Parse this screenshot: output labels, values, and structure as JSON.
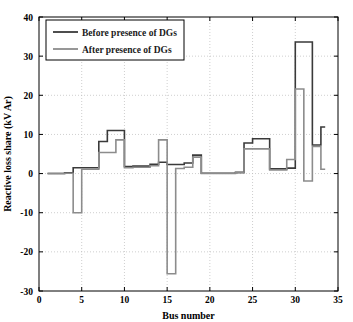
{
  "chart_data": {
    "type": "line",
    "title": "",
    "xlabel": "Bus number",
    "ylabel": "Reactive loss share (kV Ar)",
    "xlim": [
      0,
      35
    ],
    "ylim": [
      -30,
      40
    ],
    "xticks": [
      0,
      5,
      10,
      15,
      20,
      25,
      30,
      35
    ],
    "xtick_labels": [
      "0",
      "5",
      "10",
      "15",
      "20",
      "25",
      "30",
      "35"
    ],
    "yticks": [
      -30,
      -20,
      -10,
      0,
      10,
      20,
      30,
      40
    ],
    "ytick_labels": [
      "-30",
      "-20",
      "-10",
      "0",
      "10",
      "20",
      "30",
      "40"
    ],
    "grid": true,
    "legend_position": "top-left",
    "style": "stairs",
    "x": [
      1,
      2,
      3,
      4,
      5,
      6,
      7,
      8,
      9,
      10,
      11,
      12,
      13,
      14,
      15,
      16,
      17,
      18,
      19,
      20,
      21,
      22,
      23,
      24,
      25,
      26,
      27,
      28,
      29,
      30,
      31,
      32,
      33
    ],
    "series": [
      {
        "name": "Before presence of DGs",
        "color": "#3a3a3a",
        "width": 1.6,
        "values": [
          0,
          0,
          0.2,
          1.5,
          1.5,
          1.5,
          8.2,
          11.0,
          11.0,
          1.8,
          1.9,
          1.9,
          2.4,
          2.9,
          2.3,
          2.3,
          2.7,
          4.7,
          0.1,
          0.1,
          0.1,
          0.1,
          0.3,
          7.8,
          8.9,
          8.9,
          1.2,
          1.2,
          1.4,
          33.6,
          33.6,
          7.3,
          11.9
        ]
      },
      {
        "name": "After presence of DGs",
        "color": "#8c8c8c",
        "width": 1.6,
        "values": [
          0,
          0,
          0.1,
          -10.0,
          1.1,
          1.1,
          5.4,
          5.4,
          8.6,
          1.5,
          1.6,
          1.6,
          2.0,
          8.6,
          -25.6,
          1.3,
          1.6,
          4.2,
          0.0,
          0.0,
          0.0,
          0.0,
          0.2,
          6.3,
          6.3,
          6.3,
          0.9,
          0.9,
          3.6,
          21.6,
          -1.9,
          6.9,
          1.1
        ]
      }
    ]
  },
  "legend": {
    "items": [
      {
        "label": "Before presence of DGs",
        "color": "#3a3a3a"
      },
      {
        "label": "After presence of DGs",
        "color": "#8c8c8c"
      }
    ]
  },
  "axes": {
    "x_title": "Bus number",
    "y_title": "Reactive loss share (kV Ar)"
  }
}
